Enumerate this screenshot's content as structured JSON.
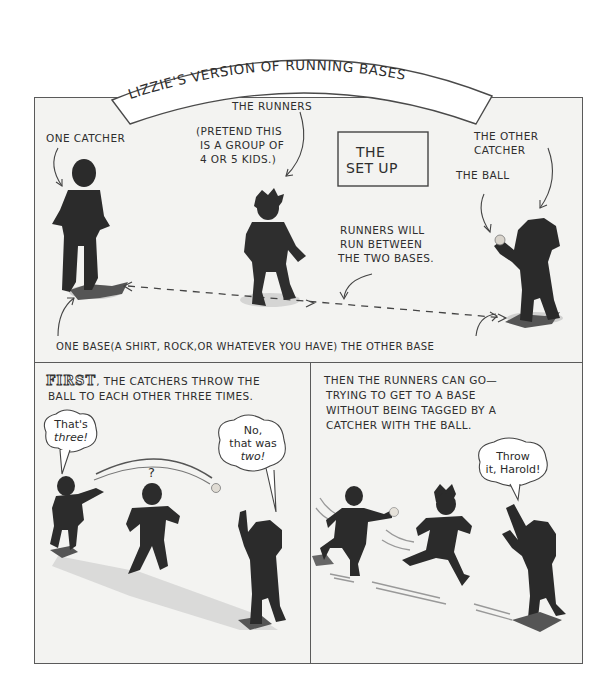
{
  "title": "LIZZIE'S VERSION OF RUNNING BASES",
  "panels": {
    "setup": {
      "heading_line1": "THE",
      "heading_line2": "SET UP",
      "labels": {
        "one_catcher": "ONE CATCHER",
        "the_runners": "THE RUNNERS",
        "pretend_line1": "(PRETEND THIS",
        "pretend_line2": "IS A GROUP OF",
        "pretend_line3": "4 OR 5 KIDS.)",
        "other_catcher_line1": "THE OTHER",
        "other_catcher_line2": "CATCHER",
        "the_ball": "THE BALL",
        "runners_will_line1": "RUNNERS WILL",
        "runners_will_line2": "RUN BETWEEN",
        "runners_will_line3": "THE TWO BASES.",
        "bases_caption": "ONE BASE(A SHIRT, ROCK,OR WHATEVER YOU HAVE) THE OTHER BASE"
      }
    },
    "first": {
      "lead_word": "FIRST",
      "caption_line1": ", THE CATCHERS THROW THE",
      "caption_line2": "BALL TO EACH OTHER THREE TIMES.",
      "bubble_left_line1": "That's",
      "bubble_left_line2": "three!",
      "bubble_right_line1": "No,",
      "bubble_right_line2": "that was",
      "bubble_right_line3": "two!",
      "question_mark": "?"
    },
    "then": {
      "caption_line1": "THEN THE RUNNERS CAN GO—",
      "caption_line2": "TRYING TO GET TO A BASE",
      "caption_line3": "WITHOUT BEING TAGGED BY A",
      "caption_line4": "CATCHER WITH THE BALL.",
      "bubble_line1": "Throw",
      "bubble_line2": "it, Harold!"
    }
  },
  "colors": {
    "paper": "#f3f3f1",
    "ink": "#2e2e2e",
    "silhouette": "#2b2b2b",
    "shadow": "#bdbdbd"
  }
}
